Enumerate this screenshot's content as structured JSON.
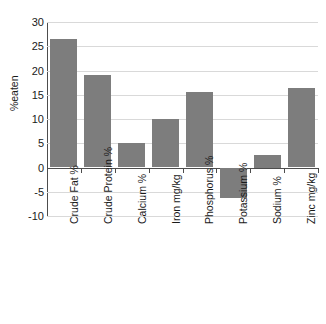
{
  "chart_data": {
    "type": "bar",
    "title": "",
    "xlabel": "",
    "ylabel": "%eaten",
    "ylim": [
      -10,
      30
    ],
    "yticks": [
      30,
      25,
      20,
      15,
      10,
      5,
      0,
      -5,
      -10
    ],
    "grid": true,
    "legend": false,
    "bar_color": "#7d7d7d",
    "categories": [
      "Crude Fat %",
      "Crude Protein %",
      "Calcium %",
      "Iron mg/kg",
      "Phosphorus %",
      "Potassium %",
      "Sodium %",
      "Zinc mg/kg"
    ],
    "values": [
      26.5,
      19.1,
      5.1,
      10.1,
      15.5,
      -6.3,
      2.5,
      16.3
    ]
  }
}
